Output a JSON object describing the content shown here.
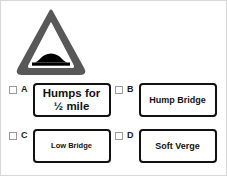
{
  "sign": {
    "name": "road-hump-warning-triangle",
    "border_color": "#585858",
    "interior_color": "#ffffff",
    "symbol_color": "#000000",
    "symbol": "road-hump"
  },
  "options": [
    {
      "letter": "A",
      "label": "Humps for ½ mile",
      "line1": "Humps for",
      "line2": "½ mile",
      "text_size": "size-lg",
      "checked": false
    },
    {
      "letter": "B",
      "label": "Hump Bridge",
      "line1": "Hump Bridge",
      "line2": "",
      "text_size": "size-md",
      "checked": false
    },
    {
      "letter": "C",
      "label": "Low Bridge",
      "line1": "Low Bridge",
      "line2": "",
      "text_size": "size-sm",
      "checked": false
    },
    {
      "letter": "D",
      "label": "Soft Verge",
      "line1": "Soft Verge",
      "line2": "",
      "text_size": "size-md",
      "checked": false
    }
  ]
}
